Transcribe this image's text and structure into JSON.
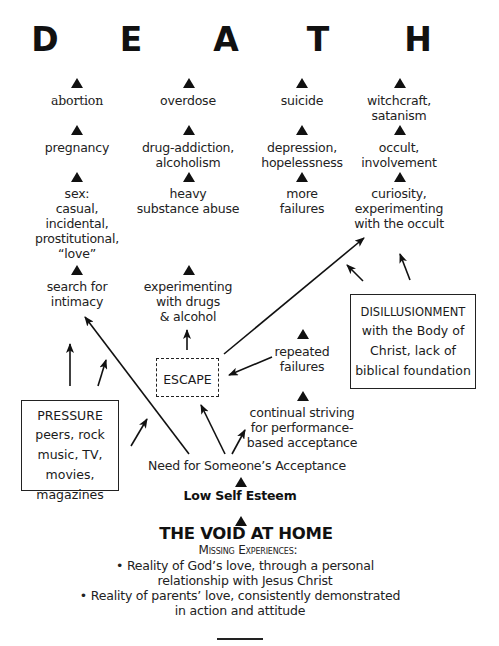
{
  "title_letters": [
    "D",
    "E",
    "A",
    "T",
    "H"
  ],
  "columns": [
    {
      "name": "sex",
      "items": [
        {
          "text": "abortion"
        },
        {
          "text": "pregnancy"
        },
        {
          "text": "sex:\ncasual,\nincidental,\nprostitutional,\n“love”"
        },
        {
          "text": "search for\nintimacy"
        }
      ]
    },
    {
      "name": "substances",
      "items": [
        {
          "text": "overdose"
        },
        {
          "text": "drug-addiction,\nalcoholism"
        },
        {
          "text": "heavy\nsubstance abuse"
        },
        {
          "text": "experimenting\nwith drugs\n& alcohol"
        }
      ]
    },
    {
      "name": "failure",
      "items": [
        {
          "text": "suicide"
        },
        {
          "text": "depression,\nhopelessness"
        },
        {
          "text": "more\nfailures"
        },
        {
          "text": "repeated\nfailures"
        },
        {
          "text": "continual striving\nfor performance-\nbased acceptance"
        }
      ]
    },
    {
      "name": "occult",
      "items": [
        {
          "text": "witchcraft,\nsatanism"
        },
        {
          "text": "occult,\ninvolvement"
        },
        {
          "text": "curiosity,\nexperimenting\nwith the occult"
        }
      ]
    }
  ],
  "boxes": {
    "escape": {
      "label": "ESCAPE",
      "style": "dashed"
    },
    "pressure": {
      "heading": "PRESSURE",
      "body": "peers, rock\nmusic, TV,\nmovies,\nmagazines"
    },
    "disillusionment": {
      "heading": "DISILLUSIONMENT",
      "body": "with the Body of\nChrist, lack of\nbiblical foundation"
    }
  },
  "root_chain": {
    "need": "Need for Someone’s Acceptance",
    "low_self_esteem": "Low Self Esteem",
    "void_title": "THE VOID AT HOME",
    "missing_heading": "Missing Experiences:",
    "bullets": [
      "• Reality of God’s love, through a personal\nrelationship with Jesus Christ",
      "• Reality of parents’ love, consistently demonstrated\nin action and attitude"
    ]
  },
  "colors": {
    "ink": "#111111",
    "text": "#222222",
    "background": "#ffffff"
  }
}
